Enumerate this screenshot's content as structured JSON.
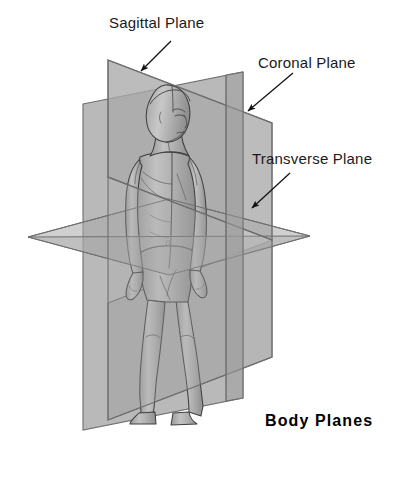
{
  "figure": {
    "title": "Body Planes",
    "background_color": "#ffffff",
    "plane_fill": "#a9a9a9",
    "plane_stroke": "#6e6e6e",
    "body_fill": "#b4b4b4",
    "body_stroke": "#4a4a4a",
    "text_color": "#1a1a1a"
  },
  "labels": {
    "sagittal": "Sagittal Plane",
    "coronal": "Coronal Plane",
    "transverse": "Transverse Plane"
  },
  "planes": [
    {
      "name": "sagittal",
      "label": "Sagittal Plane",
      "orientation": "vertical-longitudinal",
      "description": "Divides body into left and right"
    },
    {
      "name": "coronal",
      "label": "Coronal Plane",
      "orientation": "vertical-frontal",
      "description": "Divides body into front and back"
    },
    {
      "name": "transverse",
      "label": "Transverse Plane",
      "orientation": "horizontal",
      "description": "Divides body into upper and lower"
    }
  ],
  "subject": {
    "name": "human-figure",
    "pose": "standing anterior view, head turned"
  }
}
